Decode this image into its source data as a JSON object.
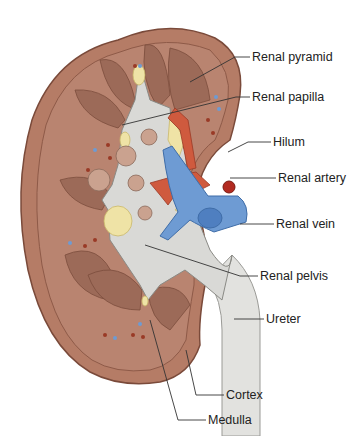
{
  "diagram": {
    "labels": [
      {
        "id": "renal-pyramid",
        "text": "Renal pyramid",
        "x": 252,
        "y": 51
      },
      {
        "id": "renal-papilla",
        "text": "Renal papilla",
        "x": 252,
        "y": 91
      },
      {
        "id": "hilum",
        "text": "Hilum",
        "x": 273,
        "y": 136
      },
      {
        "id": "renal-artery",
        "text": "Renal artery",
        "x": 278,
        "y": 171
      },
      {
        "id": "renal-vein",
        "text": "Renal vein",
        "x": 276,
        "y": 217
      },
      {
        "id": "renal-pelvis",
        "text": "Renal pelvis",
        "x": 260,
        "y": 268
      },
      {
        "id": "ureter",
        "text": "Ureter",
        "x": 266,
        "y": 312
      },
      {
        "id": "cortex",
        "text": "Cortex",
        "x": 226,
        "y": 390
      },
      {
        "id": "medulla",
        "text": "Medulla",
        "x": 208,
        "y": 414
      }
    ],
    "colors": {
      "cortex": "#b57c66",
      "cortex_edge": "#8e5a48",
      "medulla": "#9c6a58",
      "pelvis": "#d9d9d6",
      "fat": "#efe3a6",
      "artery": "#cf5a3e",
      "vein": "#6e9bd3",
      "ureter": "#e2e2df"
    }
  }
}
